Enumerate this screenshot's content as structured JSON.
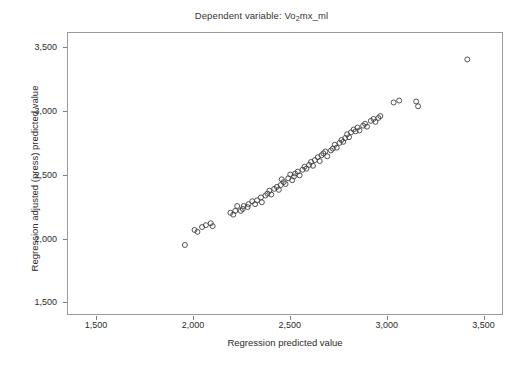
{
  "chart_data": {
    "type": "scatter",
    "title": "Dependent variable: Vo2mx_ml",
    "title_prefix": "Dependent variable: Vo",
    "title_sub": "2",
    "title_suffix": "mx_ml",
    "xlabel": "Regression predicted value",
    "ylabel": "Regression adjusted (press) predicted value",
    "xlim": [
      1350,
      3600
    ],
    "ylim": [
      1400,
      3620
    ],
    "xticks": [
      1500,
      2000,
      2500,
      3000,
      3500
    ],
    "xtick_labels": [
      "1,500",
      "2,000",
      "2,500",
      "3,000",
      "3,500"
    ],
    "yticks": [
      1500,
      2000,
      2500,
      3000,
      3500
    ],
    "ytick_labels": [
      "1,500",
      "2,000",
      "2,500",
      "3,000",
      "3,500"
    ],
    "grid": false,
    "legend": false,
    "marker": "open-circle",
    "marker_size_px": 5,
    "marker_color": "#404040",
    "frame_color": "#9a9a9a",
    "background": "#ffffff",
    "n_points": 74,
    "series": [
      {
        "name": "cases",
        "points": [
          [
            1956,
            1945
          ],
          [
            2006,
            2064
          ],
          [
            2021,
            2049
          ],
          [
            2045,
            2087
          ],
          [
            2065,
            2102
          ],
          [
            2090,
            2117
          ],
          [
            2100,
            2094
          ],
          [
            2192,
            2200
          ],
          [
            2207,
            2185
          ],
          [
            2217,
            2215
          ],
          [
            2227,
            2253
          ],
          [
            2246,
            2215
          ],
          [
            2256,
            2230
          ],
          [
            2261,
            2253
          ],
          [
            2281,
            2245
          ],
          [
            2286,
            2268
          ],
          [
            2305,
            2291
          ],
          [
            2320,
            2268
          ],
          [
            2330,
            2298
          ],
          [
            2350,
            2321
          ],
          [
            2355,
            2283
          ],
          [
            2374,
            2336
          ],
          [
            2384,
            2351
          ],
          [
            2394,
            2374
          ],
          [
            2404,
            2344
          ],
          [
            2419,
            2389
          ],
          [
            2433,
            2404
          ],
          [
            2443,
            2381
          ],
          [
            2453,
            2419
          ],
          [
            2458,
            2464
          ],
          [
            2468,
            2442
          ],
          [
            2478,
            2427
          ],
          [
            2492,
            2472
          ],
          [
            2502,
            2502
          ],
          [
            2512,
            2457
          ],
          [
            2522,
            2487
          ],
          [
            2527,
            2510
          ],
          [
            2541,
            2525
          ],
          [
            2551,
            2495
          ],
          [
            2566,
            2540
          ],
          [
            2576,
            2563
          ],
          [
            2586,
            2548
          ],
          [
            2600,
            2578
          ],
          [
            2610,
            2601
          ],
          [
            2620,
            2571
          ],
          [
            2630,
            2616
          ],
          [
            2645,
            2639
          ],
          [
            2655,
            2608
          ],
          [
            2664,
            2654
          ],
          [
            2674,
            2669
          ],
          [
            2684,
            2684
          ],
          [
            2694,
            2646
          ],
          [
            2713,
            2692
          ],
          [
            2723,
            2707
          ],
          [
            2733,
            2737
          ],
          [
            2743,
            2714
          ],
          [
            2758,
            2752
          ],
          [
            2768,
            2775
          ],
          [
            2777,
            2760
          ],
          [
            2787,
            2790
          ],
          [
            2797,
            2820
          ],
          [
            2807,
            2797
          ],
          [
            2817,
            2835
          ],
          [
            2831,
            2858
          ],
          [
            2841,
            2843
          ],
          [
            2851,
            2873
          ],
          [
            2861,
            2850
          ],
          [
            2880,
            2888
          ],
          [
            2890,
            2903
          ],
          [
            2900,
            2880
          ],
          [
            2920,
            2926
          ],
          [
            2934,
            2941
          ],
          [
            2944,
            2918
          ],
          [
            2959,
            2949
          ],
          [
            2969,
            2964
          ],
          [
            3038,
            3071
          ],
          [
            3067,
            3086
          ],
          [
            3155,
            3079
          ],
          [
            3165,
            3041
          ],
          [
            3420,
            3411
          ]
        ]
      }
    ]
  }
}
